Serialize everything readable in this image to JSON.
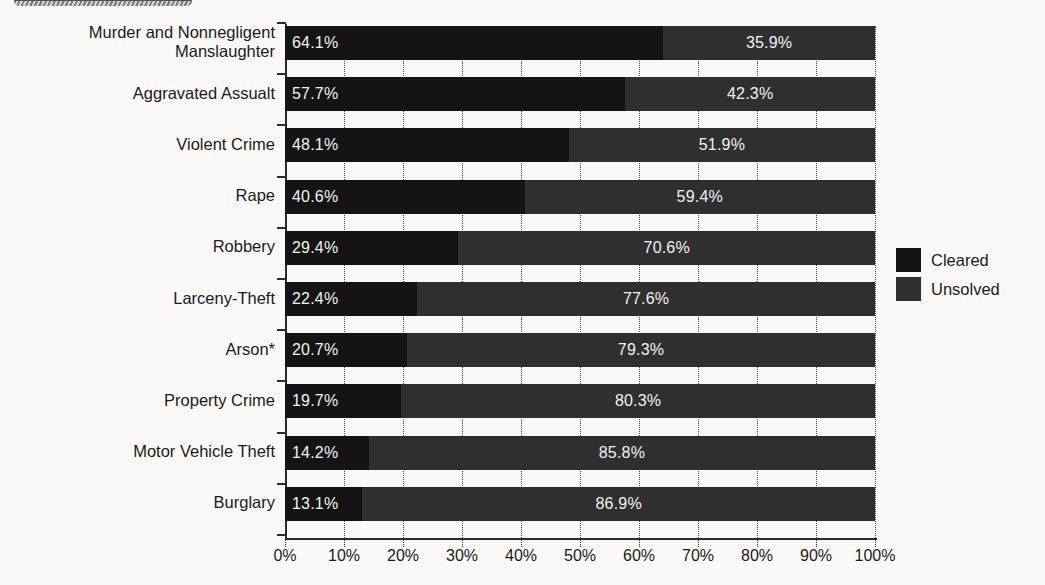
{
  "banner": {
    "name": "title-banner-fragment"
  },
  "legend": {
    "position": "right",
    "items": [
      {
        "label": "Cleared",
        "color": "#141414"
      },
      {
        "label": "Unsolved",
        "color": "#2f2f2f"
      }
    ]
  },
  "axis": {
    "x_ticks": [
      "0%",
      "10%",
      "20%",
      "30%",
      "40%",
      "50%",
      "60%",
      "70%",
      "80%",
      "90%",
      "100%"
    ]
  },
  "chart_data": {
    "type": "bar",
    "title": "",
    "xlabel": "",
    "ylabel": "",
    "orientation": "horizontal",
    "stacked": true,
    "grid": true,
    "xlim": [
      0,
      100
    ],
    "xticks": [
      0,
      10,
      20,
      30,
      40,
      50,
      60,
      70,
      80,
      90,
      100
    ],
    "xtick_labels": [
      "0%",
      "10%",
      "20%",
      "30%",
      "40%",
      "50%",
      "60%",
      "70%",
      "80%",
      "90%",
      "100%"
    ],
    "categories": [
      "Murder and Nonnegligent\nManslaughter",
      "Aggravated Assualt",
      "Violent Crime",
      "Rape",
      "Robbery",
      "Larceny-Theft",
      "Arson*",
      "Property Crime",
      "Motor Vehicle Theft",
      "Burglary"
    ],
    "series": [
      {
        "name": "Cleared",
        "color": "#141414",
        "values": [
          64.1,
          57.7,
          48.1,
          40.6,
          29.4,
          22.4,
          20.7,
          19.7,
          14.2,
          13.1
        ],
        "labels": [
          "64.1%",
          "57.7%",
          "48.1%",
          "40.6%",
          "29.4%",
          "22.4%",
          "20.7%",
          "19.7%",
          "14.2%",
          "13.1%"
        ]
      },
      {
        "name": "Unsolved",
        "color": "#2f2f2f",
        "values": [
          35.9,
          42.3,
          51.9,
          59.4,
          70.6,
          77.6,
          79.3,
          80.3,
          85.8,
          86.9
        ],
        "labels": [
          "35.9%",
          "42.3%",
          "51.9%",
          "59.4%",
          "70.6%",
          "77.6%",
          "79.3%",
          "80.3%",
          "85.8%",
          "86.9%"
        ]
      }
    ]
  }
}
